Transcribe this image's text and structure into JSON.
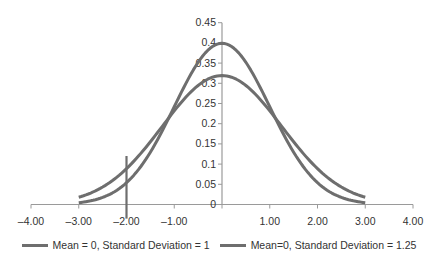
{
  "chart_data": {
    "type": "line",
    "title": "",
    "xlabel": "",
    "ylabel": "",
    "xlim": [
      -4,
      4
    ],
    "ylim": [
      0,
      0.45
    ],
    "grid": false,
    "legend_position": "bottom",
    "x_ticks": [
      "-4.00",
      "-3.00",
      "-2.00",
      "-1.00",
      "0.00",
      "1.00",
      "2.00",
      "3.00",
      "4.00"
    ],
    "x_tick_values": [
      -4,
      -3,
      -2,
      -1,
      0,
      1,
      2,
      3,
      4
    ],
    "y_ticks": [
      "0",
      "0.05",
      "0.1",
      "0.15",
      "0.2",
      "0.25",
      "0.3",
      "0.35",
      "0.4",
      "0.45"
    ],
    "y_tick_values": [
      0,
      0.05,
      0.1,
      0.15,
      0.2,
      0.25,
      0.3,
      0.35,
      0.4,
      0.45
    ],
    "x": [
      -3.0,
      -2.5,
      -2.0,
      -1.5,
      -1.0,
      -0.5,
      0.0,
      0.5,
      1.0,
      1.5,
      2.0,
      2.5,
      3.0
    ],
    "series": [
      {
        "name": "Mean = 0, Standard Deviation = 1",
        "mean": 0,
        "sd": 1,
        "color": "#6e6e6e",
        "values": [
          0.0044,
          0.0175,
          0.054,
          0.1295,
          0.242,
          0.3521,
          0.3989,
          0.3521,
          0.242,
          0.1295,
          0.054,
          0.0175,
          0.0044
        ]
      },
      {
        "name": "Mean=0, Standard Deviation = 1.25",
        "mean": 0,
        "sd": 1.25,
        "color": "#6e6e6e",
        "values": [
          0.018,
          0.0432,
          0.0887,
          0.1554,
          0.2317,
          0.2947,
          0.3191,
          0.2947,
          0.2317,
          0.1554,
          0.0887,
          0.0432,
          0.018
        ]
      }
    ],
    "annotations": [
      {
        "type": "vertical-line",
        "x": -2.0,
        "y_from": -0.035,
        "y_to": 0.12,
        "color": "#6e6e6e"
      }
    ]
  },
  "legend": {
    "items": [
      {
        "label": "Mean = 0, Standard Deviation = 1"
      },
      {
        "label": "Mean=0, Standard Deviation = 1.25"
      }
    ]
  }
}
